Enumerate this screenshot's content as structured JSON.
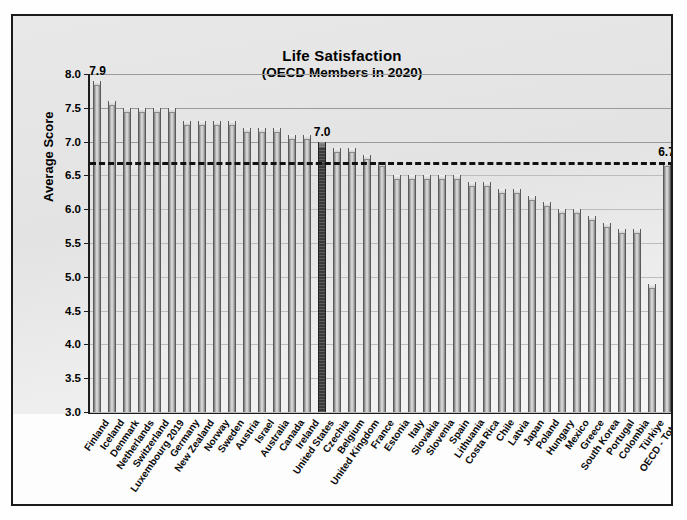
{
  "chart_data": {
    "type": "bar",
    "title": "Life Satisfaction",
    "subtitle": "(OECD Members in 2020)",
    "xlabel": "",
    "ylabel": "Average Score",
    "ylim": [
      3.0,
      8.0
    ],
    "ytick_labels": [
      "8.0",
      "7.5",
      "7.0",
      "6.5",
      "6.0",
      "5.5",
      "5.0",
      "4.5",
      "4.0",
      "3.5",
      "3.0"
    ],
    "yticks": [
      8.0,
      7.5,
      7.0,
      6.5,
      6.0,
      5.5,
      5.0,
      4.5,
      4.0,
      3.5,
      3.0
    ],
    "grid": true,
    "legend": "none",
    "reference_line": {
      "value": 6.7,
      "style": "dashed",
      "label": "OECD - Total"
    },
    "highlight_category": "United States",
    "annotations": [
      {
        "category": "Finland",
        "text": "7.9",
        "value": 7.9
      },
      {
        "category": "United States",
        "text": "7.0",
        "value": 7.0
      },
      {
        "category": "OECD - Total",
        "text": "6.7",
        "value": 6.7
      }
    ],
    "categories": [
      "Finland",
      "Iceland",
      "Denmark",
      "Netherlands",
      "Switzerland",
      "Luxembourg 2019",
      "Germany",
      "New Zealand",
      "Norway",
      "Sweden",
      "Austria",
      "Israel",
      "Australia",
      "Canada",
      "Ireland",
      "United States",
      "Czechia",
      "Belgium",
      "United Kingdom",
      "France",
      "Estonia",
      "Italy",
      "Slovakia",
      "Slovenia",
      "Spain",
      "Lithuania",
      "Costa Rica",
      "Chile",
      "Latvia",
      "Japan",
      "Poland",
      "Hungary",
      "Mexico",
      "Greece",
      "South Korea",
      "Portugal",
      "Colombia",
      "Türkiye",
      "OECD - Total"
    ],
    "values": [
      7.9,
      7.6,
      7.5,
      7.5,
      7.5,
      7.5,
      7.3,
      7.3,
      7.3,
      7.3,
      7.2,
      7.2,
      7.2,
      7.1,
      7.1,
      7.0,
      6.9,
      6.9,
      6.8,
      6.7,
      6.5,
      6.5,
      6.5,
      6.5,
      6.5,
      6.4,
      6.4,
      6.3,
      6.3,
      6.2,
      6.1,
      6.0,
      6.0,
      5.9,
      5.8,
      5.7,
      5.7,
      4.9,
      6.7
    ]
  }
}
